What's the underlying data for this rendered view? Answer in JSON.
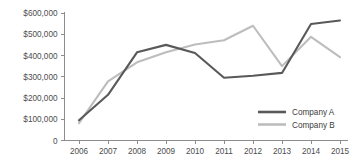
{
  "chart_data": {
    "type": "line",
    "title": "",
    "subtitle": "",
    "xlabel": "",
    "ylabel": "",
    "categories": [
      "2006",
      "2007",
      "2008",
      "2009",
      "2010",
      "2011",
      "2012",
      "2013",
      "2014",
      "2015"
    ],
    "series": [
      {
        "name": "Company A",
        "color": "#595959",
        "values": [
          95000,
          215000,
          415000,
          450000,
          412000,
          295000,
          305000,
          318000,
          548000,
          565000
        ]
      },
      {
        "name": "Company B",
        "color": "#bdbdbd",
        "values": [
          82000,
          278000,
          368000,
          415000,
          452000,
          472000,
          540000,
          350000,
          488000,
          392000
        ]
      }
    ],
    "ylim": [
      0,
      600000
    ],
    "y_ticks": [
      0,
      100000,
      200000,
      300000,
      400000,
      500000,
      600000
    ],
    "y_tick_labels": [
      "0",
      "$100,000",
      "$200,000",
      "$300,000",
      "$400,000",
      "$500,000",
      "$600,000"
    ],
    "x_tick_labels": [
      "2006",
      "2007",
      "2008",
      "2009",
      "2010",
      "2011",
      "2012",
      "2013",
      "2014",
      "2015"
    ],
    "grid": false,
    "legend_position": "inside-bottom-right",
    "legend_entries": [
      {
        "label": "Company A",
        "color": "#595959"
      },
      {
        "label": "Company B",
        "color": "#bdbdbd"
      }
    ],
    "axis_color": "#8c8c8c",
    "background": "#ffffff"
  }
}
